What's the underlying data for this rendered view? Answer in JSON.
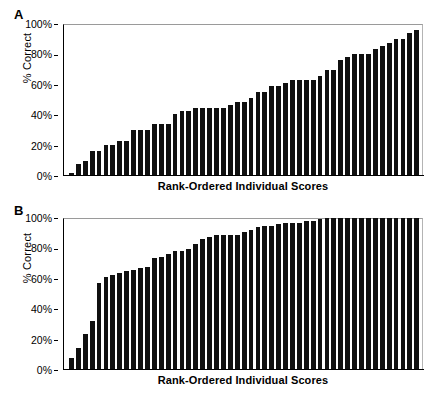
{
  "figure": {
    "background": "#ffffff",
    "bar_color": "#101010",
    "axis_color": "#000000"
  },
  "panels": [
    {
      "letter": "A",
      "ylabel": "% Correct",
      "xlabel": "Rank-Ordered Individual Scores",
      "yticks": [
        "0%",
        "20%",
        "40%",
        "60%",
        "80%",
        "100%"
      ]
    },
    {
      "letter": "B",
      "ylabel": "% Correct",
      "xlabel": "Rank-Ordered Individual Scores",
      "yticks": [
        "0%",
        "20%",
        "40%",
        "60%",
        "80%",
        "100%"
      ]
    }
  ],
  "chart_data": [
    {
      "type": "bar",
      "title": "A",
      "xlabel": "Rank-Ordered Individual Scores",
      "ylabel": "% Correct",
      "ylim": [
        0,
        100
      ],
      "yticks": [
        0,
        20,
        40,
        60,
        80,
        100
      ],
      "ytick_labels": [
        "0%",
        "20%",
        "40%",
        "60%",
        "80%",
        "100%"
      ],
      "grid": false,
      "legend": false,
      "categories": [
        "1",
        "2",
        "3",
        "4",
        "5",
        "6",
        "7",
        "8",
        "9",
        "10",
        "11",
        "12",
        "13",
        "14",
        "15",
        "16",
        "17",
        "18",
        "19",
        "20",
        "21",
        "22",
        "23",
        "24",
        "25",
        "26",
        "27",
        "28",
        "29",
        "30",
        "31",
        "32",
        "33",
        "34",
        "35",
        "36",
        "37",
        "38",
        "39",
        "40",
        "41",
        "42",
        "43",
        "44",
        "45",
        "46",
        "47",
        "48",
        "49",
        "50"
      ],
      "values": [
        2,
        8,
        10,
        16.5,
        16.5,
        20.5,
        20.5,
        23,
        23,
        30,
        30,
        30.5,
        34,
        34,
        34,
        40.5,
        42.5,
        42.5,
        44.5,
        44.5,
        45,
        45,
        45,
        46.5,
        49,
        49,
        51,
        55,
        55.5,
        59,
        59,
        61,
        63,
        63,
        63,
        63,
        66,
        70,
        70,
        76,
        78,
        80,
        80,
        80,
        83.5,
        85.5,
        87.5,
        90,
        90,
        94,
        96
      ]
    },
    {
      "type": "bar",
      "title": "B",
      "xlabel": "Rank-Ordered Individual Scores",
      "ylabel": "% Correct",
      "ylim": [
        0,
        100
      ],
      "yticks": [
        0,
        20,
        40,
        60,
        80,
        100
      ],
      "ytick_labels": [
        "0%",
        "20%",
        "40%",
        "60%",
        "80%",
        "100%"
      ],
      "grid": false,
      "legend": false,
      "categories": [
        "1",
        "2",
        "3",
        "4",
        "5",
        "6",
        "7",
        "8",
        "9",
        "10",
        "11",
        "12",
        "13",
        "14",
        "15",
        "16",
        "17",
        "18",
        "19",
        "20",
        "21",
        "22",
        "23",
        "24",
        "25",
        "26",
        "27",
        "28",
        "29",
        "30",
        "31",
        "32",
        "33",
        "34",
        "35",
        "36",
        "37",
        "38",
        "39",
        "40",
        "41",
        "42",
        "43",
        "44",
        "45",
        "46",
        "47",
        "48",
        "49",
        "50"
      ],
      "values": [
        8,
        14.5,
        24,
        32,
        57.5,
        61.5,
        62.5,
        64,
        65,
        66,
        67,
        67.5,
        74,
        74.5,
        76,
        78,
        78.5,
        79.5,
        83,
        86,
        87.5,
        88.5,
        89,
        89,
        89,
        90.5,
        92,
        94,
        94.5,
        95,
        96,
        96.5,
        97,
        97,
        98,
        98,
        99.5,
        100,
        100,
        100,
        100,
        100,
        100,
        100,
        100,
        100,
        100,
        100,
        100,
        100,
        100
      ]
    }
  ]
}
